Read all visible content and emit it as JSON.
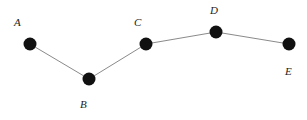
{
  "diagram": {
    "type": "path-graph",
    "edge_color": "#8a8a8a",
    "node_color": "#111111",
    "nodes": [
      {
        "id": "A",
        "label": "A",
        "x": 30,
        "y": 44,
        "lx": 14,
        "ly": 26
      },
      {
        "id": "B",
        "label": "B",
        "x": 89,
        "y": 79,
        "lx": 80,
        "ly": 108
      },
      {
        "id": "C",
        "label": "C",
        "x": 146,
        "y": 44,
        "lx": 134,
        "ly": 26
      },
      {
        "id": "D",
        "label": "D",
        "x": 216,
        "y": 32,
        "lx": 210,
        "ly": 14
      },
      {
        "id": "E",
        "label": "E",
        "x": 289,
        "y": 44,
        "lx": 285,
        "ly": 75
      }
    ],
    "edges": [
      [
        "A",
        "B"
      ],
      [
        "B",
        "C"
      ],
      [
        "C",
        "D"
      ],
      [
        "D",
        "E"
      ]
    ]
  }
}
